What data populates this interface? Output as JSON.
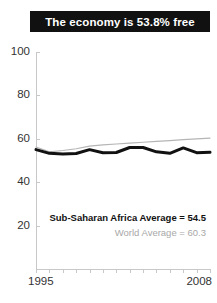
{
  "title": {
    "text": "The economy is 53.8% free"
  },
  "annotations": {
    "region_average": "Sub-Saharan Africa Average = 54.5",
    "world_average": "World Average = 60.3"
  },
  "axis": {
    "y_ticks": [
      "100",
      "80",
      "60",
      "40",
      "20"
    ],
    "x_start_label": "1995",
    "x_end_label": "2008"
  },
  "colors": {
    "title_bar": "#111111",
    "title_text": "#ffffff",
    "region_line": "#111111",
    "world_line": "#b5b5b5",
    "axis": "#c8c8c8",
    "tick_text": "#333333",
    "world_text": "#a8a8a8"
  },
  "chart_data": {
    "type": "line",
    "title": "The economy is 53.8% free",
    "xlabel": "",
    "ylabel": "",
    "xlim": [
      1995,
      2008
    ],
    "ylim": [
      0,
      100
    ],
    "yticks": [
      20,
      40,
      60,
      80,
      100
    ],
    "xticks": [
      1995,
      1996,
      1997,
      1998,
      1999,
      2000,
      2001,
      2002,
      2003,
      2004,
      2005,
      2006,
      2007,
      2008
    ],
    "grid": false,
    "legend": "none",
    "x": [
      1995,
      1996,
      1997,
      1998,
      1999,
      2000,
      2001,
      2002,
      2003,
      2004,
      2005,
      2006,
      2007,
      2008
    ],
    "series": [
      {
        "name": "Sub-Saharan Africa",
        "color": "#111111",
        "width": 3,
        "values": [
          55.0,
          53.3,
          53.0,
          53.2,
          55.0,
          53.6,
          53.7,
          56.0,
          56.0,
          54.0,
          53.3,
          55.8,
          53.6,
          53.8
        ]
      },
      {
        "name": "World",
        "color": "#b5b5b5",
        "width": 1.2,
        "values": [
          56.2,
          54.0,
          54.6,
          55.4,
          56.6,
          57.2,
          57.6,
          58.0,
          58.4,
          58.8,
          59.2,
          59.6,
          60.0,
          60.3
        ]
      }
    ]
  }
}
